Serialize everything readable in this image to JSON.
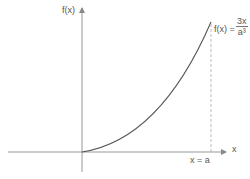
{
  "diagram": {
    "y_axis_label": "f(x)",
    "x_axis_label": "x",
    "function_label": "f(x) =",
    "function_numerator": "3x",
    "function_denominator": "a³",
    "marker_label": "x = a",
    "colors": {
      "axis": "#888888",
      "curve": "#444444",
      "dashed": "#999999",
      "text": "#555555"
    }
  }
}
